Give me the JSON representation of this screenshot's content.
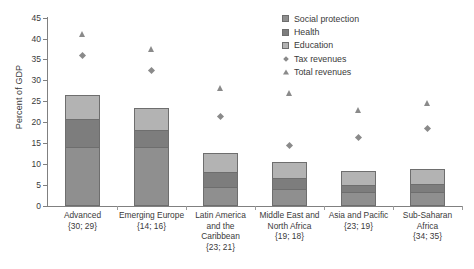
{
  "chart_data": {
    "type": "bar",
    "title": "",
    "xlabel": "",
    "ylabel": "Percent of GDP",
    "ylim": [
      0,
      45
    ],
    "ytick_step": 5,
    "yticks": [
      "0",
      "5",
      "10",
      "15",
      "20",
      "25",
      "30",
      "35",
      "40",
      "45"
    ],
    "grid": false,
    "stacked": true,
    "legend_position": "top-right",
    "categories": [
      "Advanced",
      "Emerging Europe",
      "Latin America and the Caribbean",
      "Middle East and North Africa",
      "Asia and Pacific",
      "Sub-Saharan Africa"
    ],
    "category_labels": [
      [
        "Advanced",
        "{30; 29}"
      ],
      [
        "Emerging Europe",
        "{14; 16}"
      ],
      [
        "Latin America",
        "and the",
        "Caribbean",
        "{23; 21}"
      ],
      [
        "Middle East and",
        "North Africa",
        "{19; 18}"
      ],
      [
        "Asia and Pacific",
        "{23; 19}"
      ],
      [
        "Sub-Saharan",
        "Africa",
        "{34; 35}"
      ]
    ],
    "series": [
      {
        "name": "Social protection",
        "type": "bar-segment",
        "color": "#8f8f8f",
        "values": [
          14.0,
          14.0,
          4.5,
          4.0,
          3.3,
          3.3
        ]
      },
      {
        "name": "Health",
        "type": "bar-segment",
        "color": "#7d7d7d",
        "values": [
          6.8,
          4.2,
          3.6,
          2.7,
          1.7,
          1.9
        ]
      },
      {
        "name": "Education",
        "type": "bar-segment",
        "color": "#b3b3b3",
        "values": [
          5.7,
          5.1,
          4.5,
          3.8,
          3.3,
          3.6
        ]
      },
      {
        "name": "Tax revenues",
        "type": "marker-diamond",
        "color": "#8a8a8a",
        "values": [
          36.0,
          32.4,
          21.4,
          14.5,
          16.4,
          18.6
        ]
      },
      {
        "name": "Total revenues",
        "type": "marker-triangle",
        "color": "#8a8a8a",
        "values": [
          41.0,
          37.4,
          28.3,
          27.0,
          22.9,
          24.5
        ]
      }
    ],
    "stack_tops": [
      26.5,
      23.3,
      12.6,
      10.5,
      8.3,
      8.8
    ],
    "legend_entries": [
      "Education",
      "Health",
      "Social protection",
      "Tax revenues",
      "Total revenues"
    ]
  }
}
